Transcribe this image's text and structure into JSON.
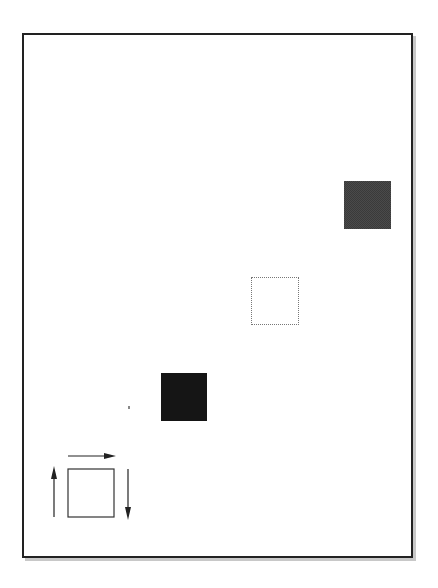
{
  "diagram": {
    "type": "motion-illustration",
    "frame": {
      "border_color": "#222222",
      "shadow_color": "#c8c8c8"
    },
    "squares": [
      {
        "id": "start",
        "style": "dark-halftone",
        "color": "#4a4a4a"
      },
      {
        "id": "middle",
        "style": "dotted-outline",
        "color": "#777777"
      },
      {
        "id": "end",
        "style": "solid-black",
        "color": "#151515"
      }
    ],
    "icon": {
      "name": "move-square-icon",
      "arrows": [
        "right",
        "down",
        "up"
      ]
    }
  }
}
